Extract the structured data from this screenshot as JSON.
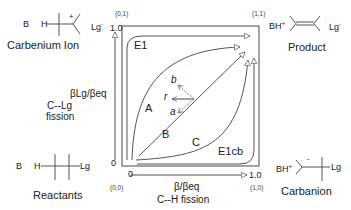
{
  "diagram": {
    "type": "More O'Ferrall-Jencks reaction coordinate diagram",
    "corners": {
      "top_left": {
        "coord": "(0,1)",
        "name": "Carbenium Ion",
        "base": "B",
        "h": "H",
        "charge": "+",
        "leaving_group": "Lg",
        "lg_charge": "-"
      },
      "top_right": {
        "coord": "(1,1)",
        "name": "Product",
        "base": "BH",
        "base_charge": "+",
        "leaving_group": "Lg",
        "lg_charge": "-"
      },
      "bottom_left": {
        "coord": "(0,0)",
        "name": "Reactants",
        "base": "B",
        "h": "H",
        "leaving_group": "Lg"
      },
      "bottom_right": {
        "coord": "(1,0)",
        "name": "Carbanion",
        "base": "BH",
        "base_charge": "+",
        "charge": "-",
        "leaving_group": "Lg"
      }
    },
    "x_axis": {
      "start": "0",
      "end": "1.0",
      "label": "β/βeq",
      "sublabel": "C--H  fission"
    },
    "y_axis": {
      "start": "0",
      "end": "1.0",
      "label": "βLg/βeq",
      "sublabel_line1": "C--Lg",
      "sublabel_line2": "fission"
    },
    "paths": {
      "e1": "E1",
      "a": "A",
      "b": "B",
      "c": "C",
      "e1cb": "E1cb"
    },
    "vectors": {
      "a": "a",
      "b": "b",
      "r": "r"
    }
  },
  "colors": {
    "line": "#555555",
    "text": "#222222"
  }
}
